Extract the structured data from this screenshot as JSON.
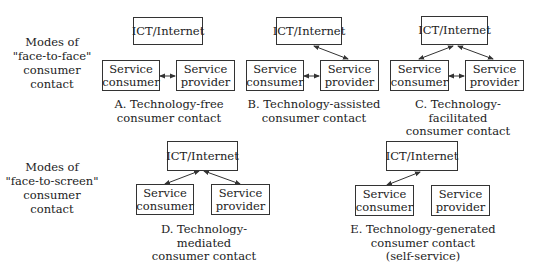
{
  "row_labels": {
    "face_to_face": [
      "Modes of",
      "\"face-to-face\"",
      "consumer contact"
    ],
    "face_to_screen": [
      "Modes of",
      "\"face-to-screen\"",
      "consumer contact"
    ]
  },
  "box_labels": {
    "ict": "ICT/Internet",
    "consumer": [
      "Service",
      "consumer"
    ],
    "provider": [
      "Service",
      "provider"
    ]
  },
  "diagrams": [
    {
      "id": "A",
      "caption": [
        "A. Technology-free",
        "consumer contact"
      ],
      "links": [
        "consumer-provider"
      ]
    },
    {
      "id": "B",
      "caption": [
        "B. Technology-assisted",
        "consumer contact"
      ],
      "links": [
        "consumer-provider",
        "ict-provider"
      ]
    },
    {
      "id": "C",
      "caption": [
        "C. Technology-facilitated",
        "consumer contact"
      ],
      "links": [
        "consumer-provider",
        "ict-consumer",
        "ict-provider"
      ]
    },
    {
      "id": "D",
      "caption": [
        "D. Technology-mediated",
        "consumer contact"
      ],
      "links": [
        "ict-consumer",
        "ict-provider"
      ]
    },
    {
      "id": "E",
      "caption": [
        "E. Technology-generated",
        "consumer contact",
        "(self-service)"
      ],
      "links": [
        "ict-consumer"
      ]
    }
  ]
}
